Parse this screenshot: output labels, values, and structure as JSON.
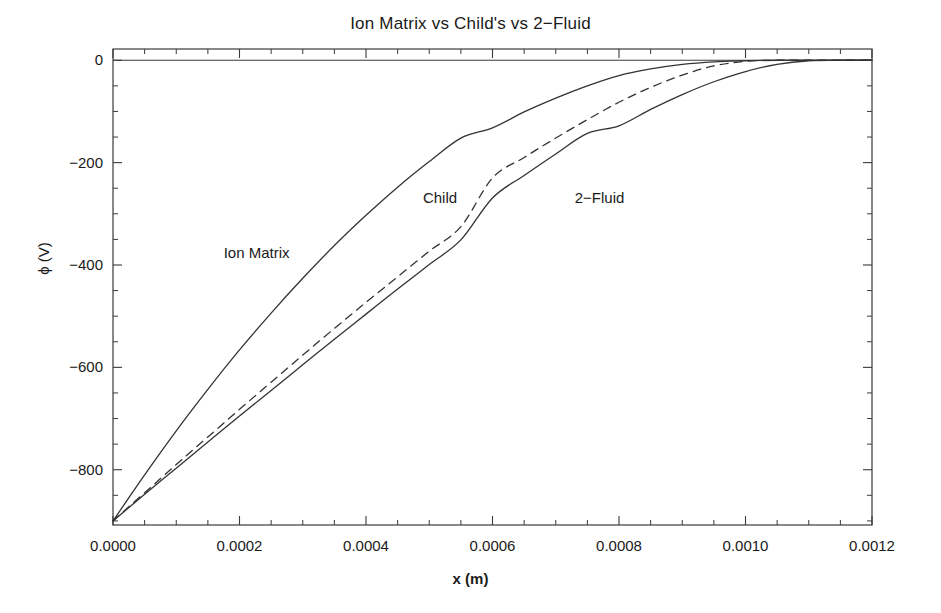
{
  "chart_data": {
    "type": "line",
    "title": "Ion Matrix vs Child's vs 2−Fluid",
    "xlabel": "x (m)",
    "ylabel": "ϕ (V)",
    "xlim": [
      0.0,
      0.0012
    ],
    "ylim": [
      -908,
      22
    ],
    "grid": false,
    "legend_position": "inline-annotations",
    "xticks": [
      0.0,
      0.0002,
      0.0004,
      0.0006,
      0.0008,
      0.001,
      0.0012
    ],
    "xtick_labels": [
      "0.0000",
      "0.0002",
      "0.0004",
      "0.0006",
      "0.0008",
      "0.0010",
      "0.0012"
    ],
    "yticks": [
      0,
      -200,
      -400,
      -600,
      -800
    ],
    "ytick_labels": [
      "0",
      "−200",
      "−400",
      "−600",
      "−800"
    ],
    "x_minor_tick_step": 5e-05,
    "y_minor_tick_step": 50,
    "series": [
      {
        "name": "Ion Matrix",
        "style": "solid",
        "color": "#333333",
        "annotation_label": "Ion Matrix",
        "annotation_x": 0.000175,
        "annotation_y": -378,
        "x": [
          0.0,
          5e-05,
          0.0001,
          0.00015,
          0.0002,
          0.00025,
          0.0003,
          0.00035,
          0.0004,
          0.00045,
          0.0005,
          0.00055,
          0.0006,
          0.00065,
          0.0007,
          0.00075,
          0.0008,
          0.00085,
          0.0009,
          0.00095,
          0.001,
          0.00105,
          0.0011,
          0.00115,
          0.0012
        ],
        "y": [
          -900,
          -810,
          -724,
          -643,
          -566,
          -494,
          -426,
          -362,
          -303,
          -248,
          -198,
          -152,
          -132,
          -101,
          -74,
          -50,
          -30,
          -17,
          -8,
          -3,
          -1,
          0,
          0,
          0,
          0
        ]
      },
      {
        "name": "Child",
        "style": "dashed",
        "color": "#333333",
        "annotation_label": "Child",
        "annotation_x": 0.00049,
        "annotation_y": -271,
        "x": [
          0.0,
          5e-05,
          0.0001,
          0.00015,
          0.0002,
          0.00025,
          0.0003,
          0.00035,
          0.0004,
          0.00045,
          0.0005,
          0.00055,
          0.0006,
          0.00065,
          0.0007,
          0.00075,
          0.0008,
          0.00085,
          0.0009,
          0.00095,
          0.001,
          0.00105,
          0.0011,
          0.00115,
          0.0012
        ],
        "y": [
          -900,
          -845,
          -790,
          -736,
          -682,
          -629,
          -576,
          -524,
          -473,
          -423,
          -373,
          -325,
          -230,
          -190,
          -152,
          -116,
          -82,
          -53,
          -29,
          -11,
          -2,
          0,
          0,
          0,
          0
        ]
      },
      {
        "name": "2-Fluid",
        "style": "solid",
        "color": "#333333",
        "annotation_label": "2−Fluid",
        "annotation_x": 0.00073,
        "annotation_y": -271,
        "x": [
          0.0,
          5e-05,
          0.0001,
          0.00015,
          0.0002,
          0.00025,
          0.0003,
          0.00035,
          0.0004,
          0.00045,
          0.0005,
          0.00055,
          0.0006,
          0.00065,
          0.0007,
          0.00075,
          0.0008,
          0.00085,
          0.0009,
          0.00095,
          0.001,
          0.00105,
          0.0011,
          0.00115,
          0.0012
        ],
        "y": [
          -900,
          -848,
          -797,
          -746,
          -695,
          -645,
          -595,
          -545,
          -496,
          -447,
          -399,
          -351,
          -269,
          -225,
          -183,
          -143,
          -128,
          -96,
          -67,
          -42,
          -22,
          -8,
          -1,
          0,
          0
        ]
      }
    ]
  },
  "figure": {
    "background_color": "#ffffff",
    "frame_color": "#3a3a3a",
    "text_color": "#1a1a1a"
  }
}
